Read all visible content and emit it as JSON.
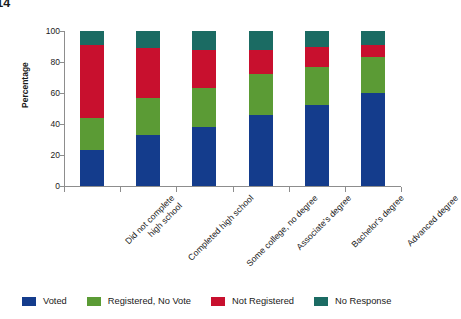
{
  "chart_data": {
    "type": "bar",
    "subtype": "stacked-bar-100",
    "title": "d States, 2014",
    "title_note_cropped": true,
    "xlabel": "",
    "ylabel": "Percentage",
    "ylim": [
      0,
      100
    ],
    "yticks": [
      0,
      20,
      40,
      60,
      80,
      100
    ],
    "grid": false,
    "legend_position": "bottom",
    "categories": [
      "Did not complete high school",
      "Completed high school",
      "Some college, no degree",
      "Associate's degree",
      "Bachelor's degree",
      "Advanced degree"
    ],
    "category_lines": [
      [
        "Did not complete",
        "high school"
      ],
      [
        "Completed high school"
      ],
      [
        "Some college, no degree"
      ],
      [
        "Associate's degree"
      ],
      [
        "Bachelor's degree"
      ],
      [
        "Advanced degree"
      ]
    ],
    "series": [
      {
        "name": "Voted",
        "color": "#143C8C",
        "values": [
          23,
          33,
          38,
          46,
          52,
          60
        ]
      },
      {
        "name": "Registered, No Vote",
        "color": "#5B9B35",
        "values": [
          21,
          24,
          25,
          26,
          25,
          23
        ]
      },
      {
        "name": "Not Registered",
        "color": "#C8102E",
        "values": [
          47,
          32,
          25,
          16,
          13,
          8
        ]
      },
      {
        "name": "No Response",
        "color": "#1B6B63",
        "values": [
          9,
          11,
          12,
          12,
          10,
          9
        ]
      }
    ]
  },
  "axes": {
    "y_title": "Percentage",
    "y_tick_labels": [
      "0",
      "20",
      "40",
      "60",
      "80",
      "100"
    ]
  },
  "legend": {
    "items": [
      {
        "label": "Voted",
        "color": "#143C8C",
        "swatch_name": "legend-swatch-voted"
      },
      {
        "label": "Registered, No Vote",
        "color": "#5B9B35",
        "swatch_name": "legend-swatch-registered-no-vote"
      },
      {
        "label": "Not Registered",
        "color": "#C8102E",
        "swatch_name": "legend-swatch-not-registered"
      },
      {
        "label": "No Response",
        "color": "#1B6B63",
        "swatch_name": "legend-swatch-no-response"
      }
    ]
  }
}
